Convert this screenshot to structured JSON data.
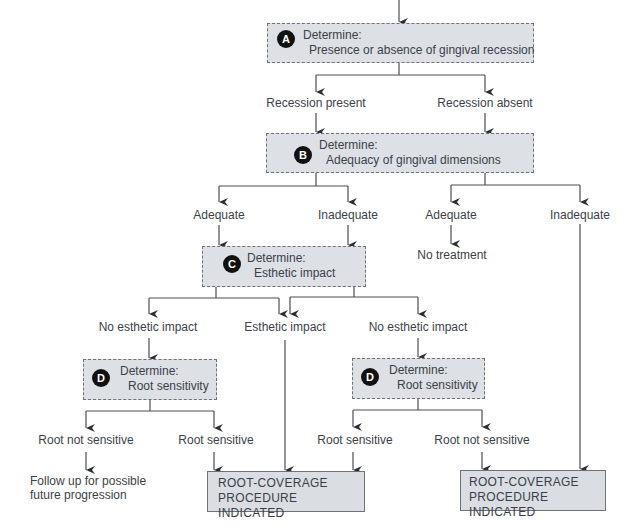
{
  "diagram": {
    "type": "decision-flowchart",
    "colors": {
      "box_fill": "#dde1e6",
      "box_border": "#6d7178",
      "badge": "#111111",
      "line": "#3b3f48"
    },
    "nodes": {
      "A": {
        "badge": "A",
        "line1": "Determine:",
        "line2": "Presence or absence of gingival recession"
      },
      "B": {
        "badge": "B",
        "line1": "Determine:",
        "line2": "Adequacy of gingival dimensions"
      },
      "C": {
        "badge": "C",
        "line1": "Determine:",
        "line2": "Esthetic impact"
      },
      "D_left": {
        "badge": "D",
        "line1": "Determine:",
        "line2": "Root sensitivity"
      },
      "D_right": {
        "badge": "D",
        "line1": "Determine:",
        "line2": "Root sensitivity"
      }
    },
    "labels": {
      "recession_present": "Recession present",
      "recession_absent": "Recession absent",
      "adequate_1": "Adequate",
      "inadequate_1": "Inadequate",
      "adequate_2": "Adequate",
      "inadequate_2": "Inadequate",
      "no_treatment": "No treatment",
      "no_esthetic_1": "No esthetic impact",
      "esthetic": "Esthetic impact",
      "no_esthetic_2": "No esthetic impact",
      "root_not_sensitive_1": "Root not sensitive",
      "root_sensitive_1": "Root sensitive",
      "root_sensitive_2": "Root sensitive",
      "root_not_sensitive_2": "Root not sensitive",
      "follow_up_1": "Follow up for possible",
      "follow_up_2": "future progression"
    },
    "outcomes": {
      "left": {
        "line1": "ROOT-COVERAGE",
        "line2": "PROCEDURE INDICATED"
      },
      "right": {
        "line1": "ROOT-COVERAGE",
        "line2": "PROCEDURE INDICATED"
      }
    }
  }
}
